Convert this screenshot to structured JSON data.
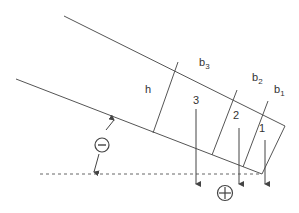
{
  "diagram": {
    "labels": {
      "h": "h",
      "b3": "b",
      "b3_sub": "3",
      "b2": "b",
      "b2_sub": "2",
      "b1": "b",
      "b1_sub": "1",
      "slice3": "3",
      "slice2": "2",
      "slice1": "1",
      "negative_sign": "−",
      "positive_sign": "+"
    },
    "colors": {
      "line": "#444444",
      "text": "#333333"
    }
  }
}
